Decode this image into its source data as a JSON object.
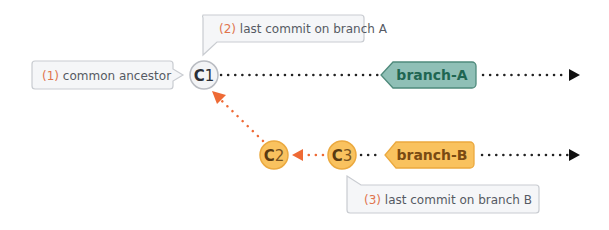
{
  "callouts": [
    {
      "number": "(1)",
      "text": " common ancestor"
    },
    {
      "number": "(2)",
      "text": " last commit on branch A"
    },
    {
      "number": "(3)",
      "text": " last commit on branch B"
    }
  ],
  "commits": [
    {
      "letter": "C",
      "num": "1"
    },
    {
      "letter": "C",
      "num": "2"
    },
    {
      "letter": "C",
      "num": "3"
    }
  ],
  "branches": [
    {
      "label": "branch-A",
      "color": "#8fbfb6",
      "text_color": "#1f6652"
    },
    {
      "label": "branch-B",
      "color": "#f9c25f",
      "text_color": "#7a4a12"
    }
  ],
  "colors": {
    "arrow_orange": "#ee6a35",
    "callout_border": "#c9ccd1",
    "callout_bg": "#f5f6f8",
    "c1_fill": "#f3f4f6",
    "c2_fill": "#f9c25f"
  }
}
